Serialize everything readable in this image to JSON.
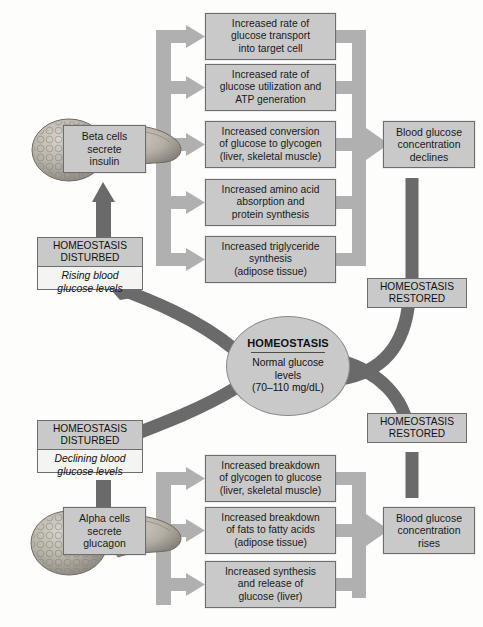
{
  "diagram": {
    "colors": {
      "box_fill": "#c9c9c9",
      "box_stroke": "#6d6d6d",
      "light_arrow": "#b0b0b0",
      "dark_arrow": "#6a6a6a",
      "page_bg": "#fdfdfb"
    }
  },
  "center": {
    "heading": "HOMEOSTASIS",
    "line1": "Normal glucose",
    "line2": "levels",
    "line3": "(70–110 mg/dL)"
  },
  "upper": {
    "disturbed": {
      "head_line1": "HOMEOSTASIS",
      "head_line2": "DISTURBED",
      "body_line1": "Rising blood",
      "body_line2": "glucose levels"
    },
    "cell_box": {
      "line1": "Beta cells",
      "line2": "secrete",
      "line3": "insulin"
    },
    "effects": [
      {
        "line1": "Increased rate of",
        "line2": "glucose transport",
        "line3": "into target cell"
      },
      {
        "line1": "Increased rate of",
        "line2": "glucose utilization and",
        "line3": "ATP generation"
      },
      {
        "line1": "Increased conversion",
        "line2": "of glucose to glycogen",
        "line3": "(liver, skeletal muscle)"
      },
      {
        "line1": "Increased amino acid",
        "line2": "absorption and",
        "line3": "protein synthesis"
      },
      {
        "line1": "Increased triglyceride",
        "line2": "synthesis",
        "line3": "(adipose tissue)"
      }
    ],
    "result": {
      "line1": "Blood glucose",
      "line2": "concentration",
      "line3": "declines"
    },
    "restored": {
      "line1": "HOMEOSTASIS",
      "line2": "RESTORED"
    }
  },
  "lower": {
    "disturbed": {
      "head_line1": "HOMEOSTASIS",
      "head_line2": "DISTURBED",
      "body_line1": "Declining blood",
      "body_line2": "glucose levels"
    },
    "cell_box": {
      "line1": "Alpha cells",
      "line2": "secrete",
      "line3": "glucagon"
    },
    "effects": [
      {
        "line1": "Increased breakdown",
        "line2": "of glycogen to glucose",
        "line3": "(liver, skeletal muscle)"
      },
      {
        "line1": "Increased breakdown",
        "line2": "of fats to fatty acids",
        "line3": "(adipose tissue)"
      },
      {
        "line1": "Increased synthesis",
        "line2": "and release of",
        "line3": "glucose (liver)"
      }
    ],
    "result": {
      "line1": "Blood glucose",
      "line2": "concentration",
      "line3": "rises"
    },
    "restored": {
      "line1": "HOMEOSTASIS",
      "line2": "RESTORED"
    }
  },
  "icons": {
    "pancreas_top": "pancreas-icon",
    "pancreas_bottom": "pancreas-icon"
  }
}
